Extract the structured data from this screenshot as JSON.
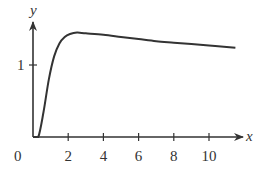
{
  "chart_data": {
    "type": "line",
    "title": "",
    "xlabel": "x",
    "ylabel": "y",
    "x_ticks": [
      2,
      4,
      6,
      8,
      10
    ],
    "x_tick_labels": [
      "2",
      "4",
      "6",
      "8",
      "10"
    ],
    "y_ticks": [
      1
    ],
    "y_tick_labels": [
      "1"
    ],
    "origin_label": "0",
    "xlim": [
      0,
      12
    ],
    "ylim": [
      0,
      1.6
    ],
    "grid": false,
    "legend": null,
    "series": [
      {
        "name": "curve",
        "x": [
          0.3,
          0.6,
          0.9,
          1.2,
          1.5,
          1.8,
          2.1,
          2.5,
          3,
          4,
          5,
          6,
          7,
          8,
          9,
          10,
          11,
          11.5
        ],
        "y": [
          0.0,
          0.35,
          0.8,
          1.12,
          1.3,
          1.39,
          1.43,
          1.45,
          1.44,
          1.42,
          1.39,
          1.36,
          1.33,
          1.31,
          1.29,
          1.27,
          1.25,
          1.24
        ]
      }
    ],
    "color": "#333333"
  }
}
